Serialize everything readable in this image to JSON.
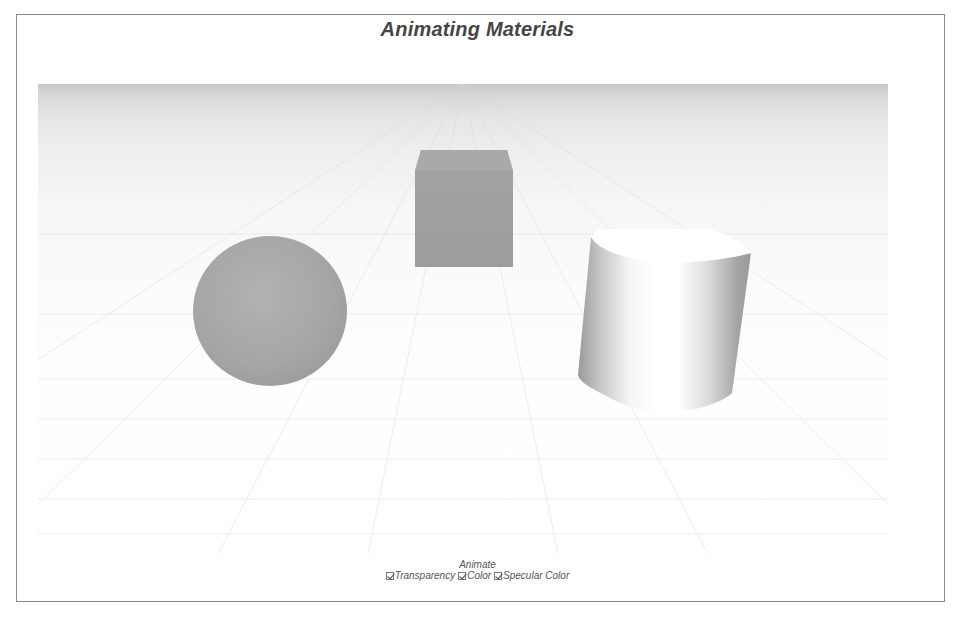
{
  "title": "Animating Materials",
  "scene": {
    "objects": [
      {
        "type": "sphere",
        "color": "#a6a6a6"
      },
      {
        "type": "cube",
        "color": "#a0a0a0"
      },
      {
        "type": "cylinder",
        "color": "#ffffff",
        "specular": true
      }
    ],
    "ground": {
      "type": "grid-plane",
      "horizon_color": "#c9c9c9"
    }
  },
  "controls": {
    "group_label": "Animate",
    "checkboxes": [
      {
        "label": "Transparency",
        "checked": true
      },
      {
        "label": "Color",
        "checked": true
      },
      {
        "label": "Specular Color",
        "checked": true
      }
    ]
  }
}
